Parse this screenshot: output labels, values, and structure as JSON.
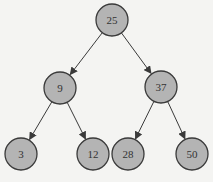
{
  "diagram": {
    "type": "binary-search-tree",
    "colors": {
      "background": "#f4f4f2",
      "node_fill": "#b4b4b4",
      "node_stroke": "#3a3a3a",
      "edge": "#3a3a3a",
      "label": "#333333"
    },
    "nodes": [
      {
        "id": "n25",
        "label": "25",
        "x": 112,
        "y": 20
      },
      {
        "id": "n9",
        "label": "9",
        "x": 60,
        "y": 88
      },
      {
        "id": "n37",
        "label": "37",
        "x": 161,
        "y": 87
      },
      {
        "id": "n3",
        "label": "3",
        "x": 21,
        "y": 154
      },
      {
        "id": "n12",
        "label": "12",
        "x": 93,
        "y": 154
      },
      {
        "id": "n28",
        "label": "28",
        "x": 128,
        "y": 154
      },
      {
        "id": "n50",
        "label": "50",
        "x": 192,
        "y": 154
      }
    ],
    "edges": [
      {
        "from": "n25",
        "to": "n9"
      },
      {
        "from": "n25",
        "to": "n37"
      },
      {
        "from": "n9",
        "to": "n3"
      },
      {
        "from": "n9",
        "to": "n12"
      },
      {
        "from": "n37",
        "to": "n28"
      },
      {
        "from": "n37",
        "to": "n50"
      }
    ],
    "node_radius": 16
  }
}
